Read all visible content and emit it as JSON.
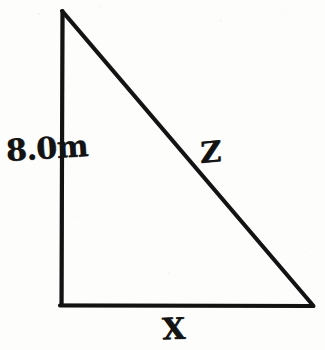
{
  "figure": {
    "type": "right-triangle-diagram",
    "medium": "handwritten-ink-on-scanned-paper",
    "ink_color": "#131313",
    "paper_color": "#fdfdfc",
    "stroke_width_px": 4,
    "canvas": {
      "width": 325,
      "height": 350
    },
    "vertices": {
      "apex": {
        "x": 62,
        "y": 11
      },
      "bottom_left": {
        "x": 61,
        "y": 305
      },
      "bottom_right": {
        "x": 313,
        "y": 306
      }
    },
    "sides": [
      {
        "name": "vertical-leg",
        "label": "8.0m",
        "from": "apex",
        "to": "bottom_left",
        "value": "8.0",
        "unit": "m"
      },
      {
        "name": "horizontal-leg",
        "label": "X",
        "from": "bottom_left",
        "to": "bottom_right",
        "value": "",
        "unit": ""
      },
      {
        "name": "hypotenuse",
        "label": "Z",
        "from": "apex",
        "to": "bottom_right",
        "value": "",
        "unit": ""
      }
    ],
    "right_angle_at": "bottom_left"
  },
  "labels": {
    "height": "8.0m",
    "hypotenuse": "Z",
    "base": "X"
  }
}
